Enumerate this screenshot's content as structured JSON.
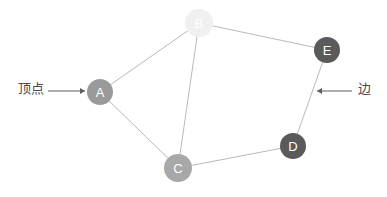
{
  "figure": {
    "kind": "graph-diagram",
    "background_color": "#ffffff",
    "width": 387,
    "height": 197
  },
  "graph": {
    "nodes": [
      {
        "id": "A",
        "label": "A",
        "cx": 100,
        "cy": 92,
        "r": 13,
        "fill": "#9a9a9a",
        "text_color": "#ffffff"
      },
      {
        "id": "B",
        "label": "B",
        "cx": 199,
        "cy": 23,
        "r": 14,
        "fill": "#f0f0f0",
        "text_color": "#7d7d7d"
      },
      {
        "id": "C",
        "label": "C",
        "cx": 178,
        "cy": 168,
        "r": 14,
        "fill": "#a8a8a8",
        "text_color": "#ffffff"
      },
      {
        "id": "D",
        "label": "D",
        "cx": 293,
        "cy": 146,
        "r": 13,
        "fill": "#5a5a5a",
        "text_color": "#ffffff"
      },
      {
        "id": "E",
        "label": "E",
        "cx": 327,
        "cy": 50,
        "r": 13,
        "fill": "#5a5a5a",
        "text_color": "#ffffff"
      }
    ],
    "edges": [
      {
        "from": "A",
        "to": "B"
      },
      {
        "from": "B",
        "to": "E"
      },
      {
        "from": "B",
        "to": "C"
      },
      {
        "from": "A",
        "to": "C"
      },
      {
        "from": "C",
        "to": "D"
      },
      {
        "from": "D",
        "to": "E"
      }
    ],
    "edge_color": "#b9b9b9"
  },
  "annotations": {
    "vertex": {
      "text": "顶点",
      "points_to": "A",
      "arrow": {
        "x1": 48,
        "y1": 91,
        "x2": 85,
        "y2": 91,
        "direction": "right"
      }
    },
    "edge": {
      "text": "边",
      "points_to": "D-E",
      "arrow": {
        "x1": 352,
        "y1": 91,
        "x2": 317,
        "y2": 91,
        "direction": "left"
      }
    },
    "arrow_color": "#5e5e5e"
  }
}
